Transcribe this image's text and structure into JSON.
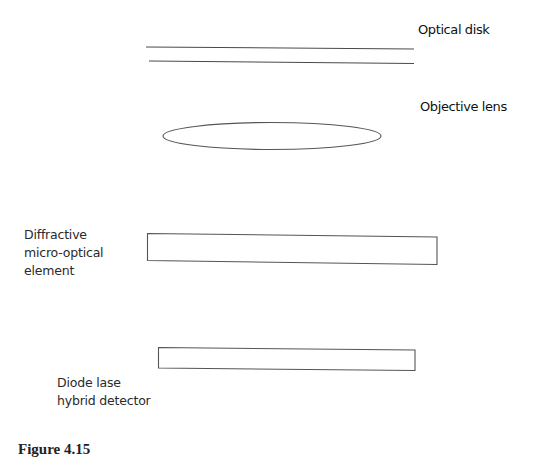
{
  "diagram": {
    "labels": {
      "optical_disk": "Optical disk",
      "objective_lens": "Objective lens",
      "diffractive_element": [
        "Diffractive",
        "micro-optical",
        "element"
      ],
      "diode_laser_detector": [
        "Diode lase",
        "hybrid detector"
      ]
    },
    "caption": {
      "figure_number": "Figure 4.15"
    },
    "colors": {
      "stroke": "#4a4a4a",
      "text": "#2a2a2a",
      "background": "#ffffff"
    }
  }
}
